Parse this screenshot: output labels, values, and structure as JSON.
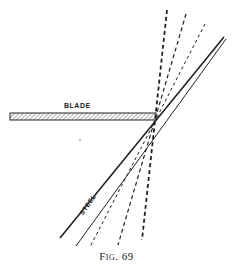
{
  "figure": {
    "caption": "Fig. 69",
    "labels": {
      "blade": "BLADE",
      "steel": "STEEL"
    },
    "colors": {
      "ink": "#222222",
      "background": "#ffffff",
      "hatch": "#888888"
    },
    "geometry": {
      "blade": {
        "x1": 10,
        "x2": 156,
        "y_top": 113,
        "y_bottom": 120
      },
      "pivot": {
        "x": 155,
        "y": 116
      },
      "steel_lines": [
        {
          "x1": 224,
          "y1": 37,
          "x2": 60,
          "y2": 238
        },
        {
          "x1": 226,
          "y1": 39,
          "x2": 76,
          "y2": 246
        }
      ],
      "dashed_lines": [
        {
          "x1": 167,
          "y1": 10,
          "x2": 142,
          "y2": 240
        },
        {
          "x1": 186,
          "y1": 14,
          "x2": 118,
          "y2": 245
        },
        {
          "x1": 205,
          "y1": 24,
          "x2": 90,
          "y2": 247
        }
      ]
    }
  }
}
